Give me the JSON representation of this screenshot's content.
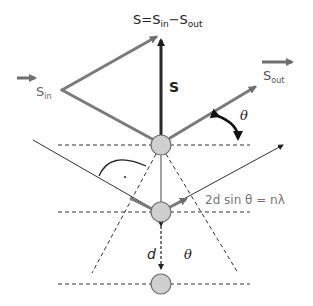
{
  "diagram": {
    "colors": {
      "vector_gray": "#7a7a7a",
      "dark": "#222222",
      "atom_fill": "#cfcfcf",
      "atom_stroke": "#6e6e6e",
      "label_gray": "#777777"
    },
    "labels": {
      "scattering_vector_eq": {
        "s": "S",
        "eq": "=",
        "s_in": "S",
        "in_sub": "in",
        "minus": "−",
        "s_out": "S",
        "out_sub": "out"
      },
      "s_in": {
        "main": "S",
        "sub": "in"
      },
      "s_out": {
        "main": "S",
        "sub": "out"
      },
      "s_vector": "S",
      "theta_top": "θ",
      "bragg_law": "2d sin θ = nλ",
      "d_spacing": "d",
      "theta_bottom": "θ",
      "right_angle_dot": "·"
    },
    "atoms": [
      {
        "name": "atom-top",
        "cx": 161,
        "cy": 145
      },
      {
        "name": "atom-middle",
        "cx": 161,
        "cy": 212
      },
      {
        "name": "atom-bottom",
        "cx": 161,
        "cy": 284
      }
    ],
    "lattice_planes_y": [
      145,
      212,
      284
    ]
  }
}
